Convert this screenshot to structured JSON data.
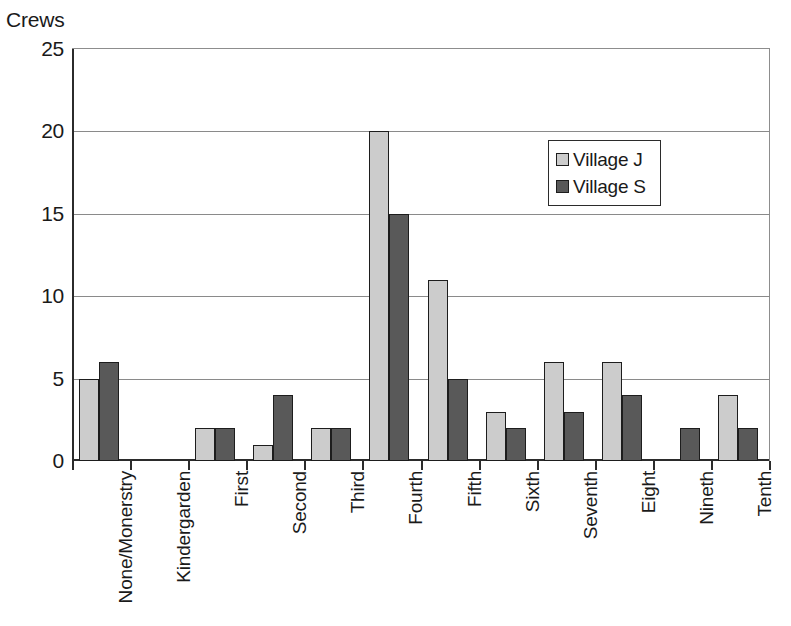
{
  "chart_data": {
    "type": "bar",
    "title": "",
    "subtitle": "",
    "xlabel": "",
    "ylabel": "Crews",
    "ylim": [
      0,
      25
    ],
    "ytick_values": [
      0,
      5,
      10,
      15,
      20,
      25
    ],
    "ytick_labels": [
      "0",
      "5",
      "10",
      "15",
      "20",
      "25"
    ],
    "grid": true,
    "grid_axis": "y",
    "legend_position": "inside-upper-right",
    "categories": [
      "None/Monerstry",
      "Kindergarden",
      "First",
      "Second",
      "Third",
      "Fourth",
      "Fifth",
      "Sixth",
      "Seventh",
      "Eight",
      "Nineth",
      "Tenth"
    ],
    "series": [
      {
        "name": "Village J",
        "color": "#cccccc",
        "values": [
          5,
          0,
          2,
          1,
          2,
          20,
          11,
          3,
          6,
          6,
          0,
          4
        ]
      },
      {
        "name": "Village S",
        "color": "#595959",
        "values": [
          6,
          0,
          2,
          4,
          2,
          15,
          5,
          2,
          3,
          4,
          2,
          2
        ]
      }
    ]
  },
  "legend": {
    "entries": [
      {
        "label": "Village J"
      },
      {
        "label": "Village S"
      }
    ]
  },
  "colors": {
    "series_j": "#cccccc",
    "series_s": "#595959",
    "axis": "#2b2b2b",
    "grid": "#8a8a8a",
    "text": "#1a1a1a",
    "background": "#ffffff"
  }
}
